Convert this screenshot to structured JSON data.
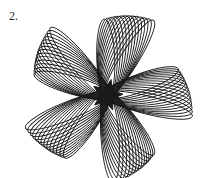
{
  "figure": {
    "label": "2.",
    "petals": 5,
    "loops_per_petal": 14,
    "center": [
      107,
      95
    ],
    "line_color": "#1a1a1a"
  }
}
